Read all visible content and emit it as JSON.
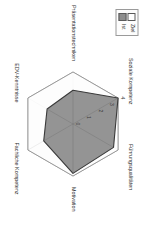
{
  "legend": {
    "items": [
      {
        "label": "Ziel",
        "color": "#ffffff",
        "swatch": "ziel"
      },
      {
        "label": "Ist",
        "color": "#8e8e8e",
        "swatch": "ist"
      }
    ]
  },
  "chart_data": {
    "type": "radar",
    "title": "",
    "xlabel": "",
    "ylabel": "",
    "categories": [
      "Führungsqualitäten",
      "Motivation",
      "Fachliche Kompetenz",
      "EDV-Kenntnisse",
      "Präsentationstechniken",
      "Soziale Kompetenz"
    ],
    "tick_labels": [
      "0",
      "1",
      "2",
      "3",
      "4"
    ],
    "ylim": [
      0,
      4
    ],
    "grid": true,
    "legend_position": "top-left",
    "rotation_deg": 90,
    "series": [
      {
        "name": "Ziel",
        "color": "#ffffff",
        "line_color": "#8a8a8a",
        "values": [
          4,
          4,
          4,
          4,
          4,
          4
        ]
      },
      {
        "name": "Ist",
        "color": "#8e8e8e",
        "line_color": "#3a3a3a",
        "values": [
          3.6,
          3.8,
          2.6,
          2.3,
          2.6,
          4.0
        ]
      }
    ]
  }
}
